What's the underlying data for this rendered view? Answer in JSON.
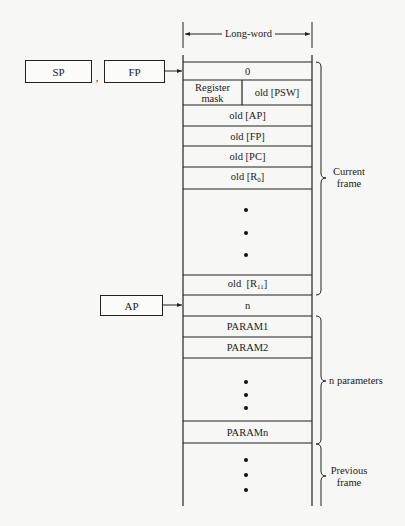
{
  "dimension": {
    "label": "Long-word"
  },
  "registers": {
    "sp": {
      "label": "SP"
    },
    "fp": {
      "label": "FP"
    },
    "ap": {
      "label": "AP"
    },
    "separator": ","
  },
  "stack": {
    "rows": [
      {
        "id": "zero",
        "label": "0"
      },
      {
        "id": "mask-psw",
        "left": "Register mask",
        "right": "old [PSW]"
      },
      {
        "id": "old-ap",
        "label": "old [AP]"
      },
      {
        "id": "old-fp",
        "label": "old [FP]"
      },
      {
        "id": "old-pc",
        "label": "old [PC]"
      },
      {
        "id": "old-r0",
        "label": "old [R",
        "sub": "0",
        "close": "]"
      },
      {
        "id": "ellipsis-regs",
        "label": "• • •"
      },
      {
        "id": "old-r11",
        "label": "old  [R",
        "sub": "11",
        "close": "]"
      },
      {
        "id": "n",
        "label": "n"
      },
      {
        "id": "param1",
        "label": "PARAM1"
      },
      {
        "id": "param2",
        "label": "PARAM2"
      },
      {
        "id": "ellipsis-params",
        "label": "• • •"
      },
      {
        "id": "paramn",
        "label": "PARAMn"
      },
      {
        "id": "ellipsis-prev",
        "label": "• • •"
      }
    ]
  },
  "braces": {
    "current_frame": "Current frame",
    "current_frame_line1": "Current",
    "current_frame_line2": "frame",
    "n_parameters": "n parameters",
    "previous_frame_line1": "Previous",
    "previous_frame_line2": "frame"
  }
}
